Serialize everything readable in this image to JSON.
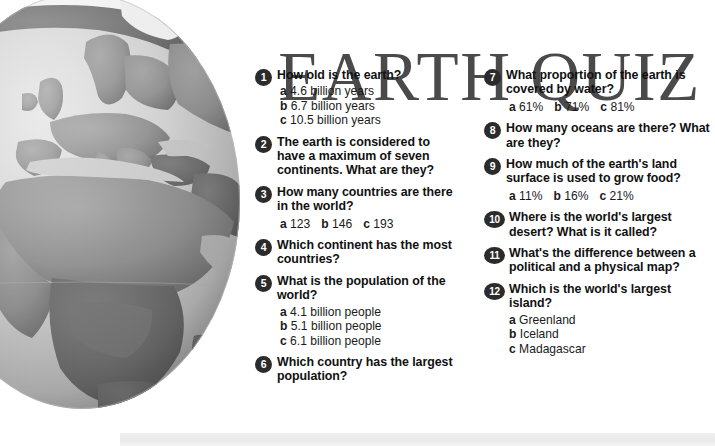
{
  "title": "EARTH QUIZ",
  "illustration": {
    "name": "globe-illustration",
    "description": "Grayscale globe showing Europe and Africa",
    "colors": {
      "ocean_light": "#d8d8d8",
      "ocean_mid": "#b9b9b9",
      "land_light": "#a8a8a8",
      "land_dark": "#6f6f6f",
      "ice": "#f0f0f0"
    }
  },
  "theme": {
    "title_color": "#4a4a4a",
    "bullet_bg": "#2b2b2b",
    "bullet_fg": "#ffffff",
    "text_color": "#111111",
    "page_bg": "#ffffff",
    "strip_color": "#ececec"
  },
  "columns": [
    {
      "id": "left",
      "questions": [
        {
          "number": "1",
          "text": "How old is the earth?",
          "answer_layout": "stacked",
          "answers": [
            {
              "label": "a",
              "value": "4.6 billion years"
            },
            {
              "label": "b",
              "value": "6.7 billion years"
            },
            {
              "label": "c",
              "value": "10.5 billion years"
            }
          ]
        },
        {
          "number": "2",
          "text": "The earth is considered to have a maximum of seven continents. What are they?",
          "answer_layout": "none",
          "answers": []
        },
        {
          "number": "3",
          "text": "How many countries are there in the world?",
          "answer_layout": "inline",
          "answers": [
            {
              "label": "a",
              "value": "123"
            },
            {
              "label": "b",
              "value": "146"
            },
            {
              "label": "c",
              "value": "193"
            }
          ]
        },
        {
          "number": "4",
          "text": "Which continent has the most countries?",
          "answer_layout": "none",
          "answers": []
        },
        {
          "number": "5",
          "text": "What is the population of the world?",
          "answer_layout": "stacked",
          "answers": [
            {
              "label": "a",
              "value": "4.1 billion people"
            },
            {
              "label": "b",
              "value": "5.1 billion people"
            },
            {
              "label": "c",
              "value": "6.1 billion people"
            }
          ]
        },
        {
          "number": "6",
          "text": "Which country has the largest population?",
          "answer_layout": "none",
          "answers": []
        }
      ]
    },
    {
      "id": "right",
      "questions": [
        {
          "number": "7",
          "text": "What proportion of the earth is covered by water?",
          "answer_layout": "inline",
          "answers": [
            {
              "label": "a",
              "value": "61%"
            },
            {
              "label": "b",
              "value": "71%"
            },
            {
              "label": "c",
              "value": "81%"
            }
          ]
        },
        {
          "number": "8",
          "text": "How many oceans are there? What are they?",
          "answer_layout": "none",
          "answers": []
        },
        {
          "number": "9",
          "text": "How much of the earth's land surface is used to grow food?",
          "answer_layout": "inline",
          "answers": [
            {
              "label": "a",
              "value": "11%"
            },
            {
              "label": "b",
              "value": "16%"
            },
            {
              "label": "c",
              "value": "21%"
            }
          ]
        },
        {
          "number": "10",
          "text": "Where is the world's largest desert? What is it called?",
          "answer_layout": "none",
          "answers": []
        },
        {
          "number": "11",
          "text": "What's the difference between a political and a physical map?",
          "answer_layout": "none",
          "answers": []
        },
        {
          "number": "12",
          "text": "Which is the world's largest island?",
          "answer_layout": "stacked",
          "answers": [
            {
              "label": "a",
              "value": "Greenland"
            },
            {
              "label": "b",
              "value": "Iceland"
            },
            {
              "label": "c",
              "value": "Madagascar"
            }
          ]
        }
      ]
    }
  ]
}
